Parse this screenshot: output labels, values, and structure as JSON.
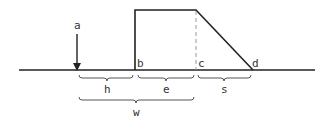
{
  "diagram": {
    "labels": {
      "a": "a",
      "b": "b",
      "c": "c",
      "d": "d",
      "h": "h",
      "e": "e",
      "s": "s",
      "w": "w"
    },
    "colors": {
      "line": "#222222",
      "dashed": "#999999",
      "text": "#333333"
    }
  }
}
